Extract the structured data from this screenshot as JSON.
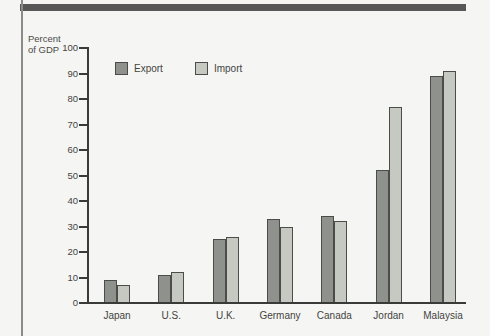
{
  "page": {
    "background": "#f5f5f3",
    "top_rule_color": "#575757",
    "left_rule_color": "#8b8b89"
  },
  "chart_data": {
    "type": "bar",
    "title": "",
    "ylabel": "Percent of GDP",
    "ylabel_lines": {
      "line1": "Percent",
      "line2": "of GDP"
    },
    "xlabel": "",
    "categories": [
      "Japan",
      "U.S.",
      "U.K.",
      "Germany",
      "Canada",
      "Jordan",
      "Malaysia"
    ],
    "series": [
      {
        "name": "Export",
        "color": "#8f918d",
        "values": [
          9,
          11,
          25,
          33,
          34,
          52,
          89
        ]
      },
      {
        "name": "Import",
        "color": "#c6c8c2",
        "values": [
          7,
          12,
          26,
          30,
          32,
          77,
          91
        ]
      }
    ],
    "ylim": [
      0,
      100
    ],
    "ytick_step": 10,
    "yticks": [
      0,
      10,
      20,
      30,
      40,
      50,
      60,
      70,
      80,
      90,
      100
    ],
    "grid": false,
    "legend_position": "top-left-inside",
    "bar_outline_color": "#4c4c48",
    "axis_color": "#3a3a38"
  }
}
